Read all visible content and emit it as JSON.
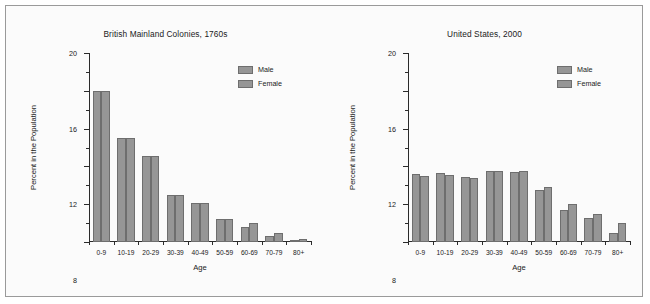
{
  "figure": {
    "background": "#fbfbfb",
    "border_color": "#9a9a9a",
    "bar_fill": "#969696",
    "bar_stroke": "#6e6e6e"
  },
  "charts": [
    {
      "id": "colonies",
      "title": "British Mainland Colonies, 1760s",
      "xlabel": "Age",
      "ylabel": "Percent in the Population",
      "legend": [
        {
          "label": "Male",
          "swatch": "#969696"
        },
        {
          "label": "Female",
          "swatch": "#969696"
        }
      ]
    },
    {
      "id": "united-states",
      "title": "United States, 2000",
      "xlabel": "Age",
      "ylabel": "Percent in the Population",
      "legend": [
        {
          "label": "Male",
          "swatch": "#969696"
        },
        {
          "label": "Female",
          "swatch": "#969696"
        }
      ]
    }
  ],
  "chart_data": [
    {
      "type": "bar",
      "id": "colonies",
      "title": "British Mainland Colonies, 1760s",
      "xlabel": "Age",
      "ylabel": "Percent in the Population",
      "categories": [
        "0-9",
        "10-19",
        "20-29",
        "30-39",
        "40-49",
        "50-59",
        "60-69",
        "70-79",
        "80+"
      ],
      "series": [
        {
          "name": "Male",
          "values": [
            16.0,
            11.0,
            9.1,
            5.0,
            4.1,
            2.4,
            1.6,
            0.6,
            0.15
          ]
        },
        {
          "name": "Female",
          "values": [
            16.0,
            11.0,
            9.1,
            5.0,
            4.1,
            2.4,
            2.0,
            1.0,
            0.3
          ]
        }
      ],
      "ylim": [
        0,
        20
      ],
      "yticks": [
        0,
        4,
        8,
        12,
        16,
        20
      ],
      "yticks_minor": [
        2,
        6,
        10,
        14,
        18
      ],
      "grid": false,
      "legend_position": "top-right"
    },
    {
      "type": "bar",
      "id": "united-states",
      "title": "United States, 2000",
      "xlabel": "Age",
      "ylabel": "Percent in the Population",
      "categories": [
        "0-9",
        "10-19",
        "20-29",
        "30-39",
        "40-49",
        "50-59",
        "60-69",
        "70-79",
        "80+"
      ],
      "series": [
        {
          "name": "Male",
          "values": [
            7.2,
            7.3,
            6.9,
            7.5,
            7.4,
            5.5,
            3.4,
            2.5,
            1.0
          ]
        },
        {
          "name": "Female",
          "values": [
            7.0,
            7.1,
            6.8,
            7.5,
            7.5,
            5.8,
            4.0,
            3.0,
            2.0
          ]
        }
      ],
      "ylim": [
        0,
        20
      ],
      "yticks": [
        0,
        4,
        8,
        12,
        16,
        20
      ],
      "yticks_minor": [
        2,
        6,
        10,
        14,
        18
      ],
      "grid": false,
      "legend_position": "top-right"
    }
  ]
}
